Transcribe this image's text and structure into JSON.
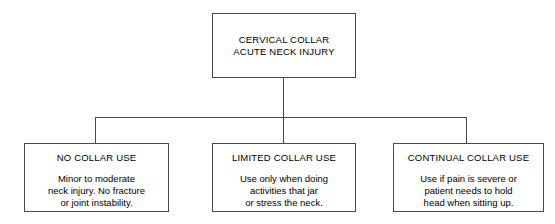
{
  "diagram": {
    "type": "flowchart",
    "orientation": "top-down",
    "root": {
      "title": "CERVICAL COLLAR\nACUTE NECK INJURY"
    },
    "branches": [
      {
        "id": "no-collar-use",
        "heading": "NO COLLAR USE",
        "body": "Minor to moderate\nneck injury. No fracture\nor joint instability."
      },
      {
        "id": "limited-collar-use",
        "heading": "LIMITED COLLAR USE",
        "body": "Use only when doing\nactivities that jar\nor stress the neck."
      },
      {
        "id": "continual-collar-use",
        "heading": "CONTINUAL COLLAR USE",
        "body": "Use if pain is severe or\npatient needs to hold\nhead when sitting up."
      }
    ],
    "colors": {
      "background": "#ffffff",
      "border": "#4a4a4a",
      "text": "#000000"
    }
  }
}
